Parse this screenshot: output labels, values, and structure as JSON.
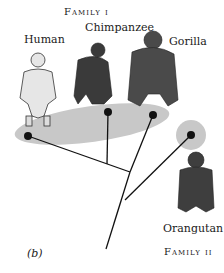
{
  "figure": {
    "panel_label": "(b)",
    "groups": [
      {
        "name": "Family I",
        "label": "Family i",
        "members": [
          "Human",
          "Chimpanzee",
          "Gorilla"
        ]
      },
      {
        "name": "Family II",
        "label": "Family ii",
        "members": [
          "Orangutan"
        ]
      }
    ],
    "taxa": [
      {
        "name": "Human",
        "node": [
          28,
          136
        ]
      },
      {
        "name": "Chimpanzee",
        "node": [
          108,
          112
        ]
      },
      {
        "name": "Gorilla",
        "node": [
          153,
          115
        ]
      },
      {
        "name": "Orangutan",
        "node": [
          191,
          135
        ]
      }
    ],
    "colors": {
      "grouping_fill": "#c8c8c8",
      "line": "#111111",
      "node": "#111111"
    }
  }
}
